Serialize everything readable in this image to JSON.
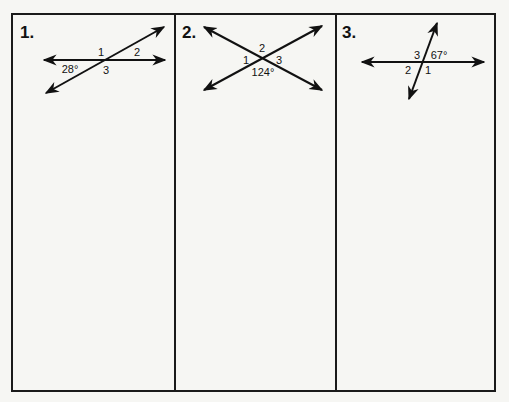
{
  "worksheet": {
    "panels": [
      {
        "number": "1.",
        "labels": {
          "angle1": "1",
          "angle2": "2",
          "angle3": "3",
          "given": "28°"
        },
        "given_angle_degrees": 28
      },
      {
        "number": "2.",
        "labels": {
          "angle1": "1",
          "angle2": "2",
          "angle3": "3",
          "given": "124°"
        },
        "given_angle_degrees": 124
      },
      {
        "number": "3.",
        "labels": {
          "angle1": "1",
          "angle2": "2",
          "angle3": "3",
          "given": "67°"
        },
        "given_angle_degrees": 67
      }
    ]
  },
  "colors": {
    "ink": "#111111",
    "paper": "#f6f6f3",
    "frame": "#1a1a1a"
  }
}
